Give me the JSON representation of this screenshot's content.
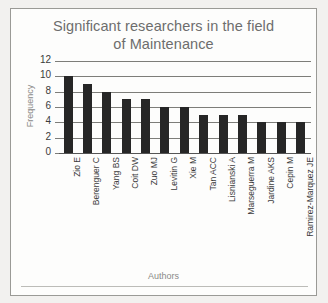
{
  "chart_data": {
    "type": "bar",
    "title": "Significant researchers in the field of Maintenance",
    "title_line1": "Significant researchers in the field",
    "title_line2": "of Maintenance",
    "xlabel": "Authors",
    "ylabel": "Frequency",
    "ylim": [
      0,
      12
    ],
    "ytick_labels": [
      "0",
      "2",
      "4",
      "6",
      "8",
      "10",
      "12"
    ],
    "yticks": [
      0,
      2,
      4,
      6,
      8,
      10,
      12
    ],
    "grid": true,
    "legend": null,
    "bar_color": "#262626",
    "categories": [
      "Zio E",
      "Berenguer C",
      "Yang BS",
      "Coit DW",
      "Zuo MJ",
      "Levitin G",
      "Xie M",
      "Tan ACC",
      "Lisnianski A",
      "Marseguerra M",
      "Jardine AKS",
      "Cepin M",
      "Ramirez-Marquez JE"
    ],
    "values": [
      10,
      9,
      8,
      7,
      7,
      6,
      6,
      5,
      5,
      5,
      4,
      4,
      4
    ]
  }
}
